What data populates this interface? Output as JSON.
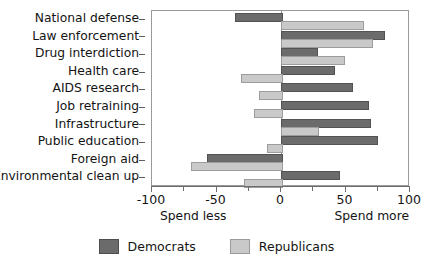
{
  "chart_data": {
    "type": "bar",
    "orientation": "horizontal",
    "title": "",
    "xlabel": "",
    "ylabel": "",
    "xlim": [
      -100,
      100
    ],
    "xticks": [
      -100,
      -50,
      0,
      50,
      100
    ],
    "xticklabels": [
      "-100",
      "-50",
      "0",
      "50",
      "100"
    ],
    "minor_xticks": [
      -75,
      -25,
      25,
      75
    ],
    "grid": false,
    "zero_reference_line": true,
    "axis_note_left": "Spend less",
    "axis_note_right": "Spend more",
    "legend_position": "bottom-center",
    "categories": [
      "National defense",
      "Law enforcement",
      "Drug interdiction",
      "Health care",
      "AIDS research",
      "Job retraining",
      "Infrastructure",
      "Public education",
      "Foreign aid",
      "Environmental clean up"
    ],
    "series": [
      {
        "name": "Democrats",
        "color": "#6b6b6b",
        "values": [
          -36,
          79,
          27,
          40,
          54,
          67,
          68,
          74,
          -57,
          44
        ]
      },
      {
        "name": "Republicans",
        "color": "#c9c9c9",
        "values": [
          63,
          70,
          48,
          -31,
          -17,
          -21,
          28,
          -11,
          -70,
          -29
        ]
      }
    ]
  },
  "legend": {
    "items": [
      {
        "label": "Democrats",
        "swatch": "dem"
      },
      {
        "label": "Republicans",
        "swatch": "rep"
      }
    ]
  }
}
